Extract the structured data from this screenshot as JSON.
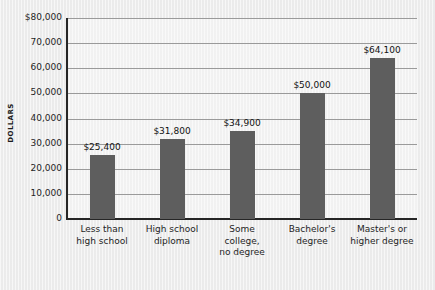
{
  "chart_data": {
    "type": "bar",
    "title": "",
    "xlabel": "",
    "ylabel": "DOLLARS",
    "ylim": [
      0,
      80000
    ],
    "grid": true,
    "legend": "none",
    "categories": [
      "Less than\nhigh school",
      "High school\ndiploma",
      "Some\ncollege,\nno degree",
      "Bachelor's\ndegree",
      "Master's or\nhigher degree"
    ],
    "values": [
      25400,
      31800,
      34900,
      50000,
      64100
    ],
    "value_labels": [
      "$25,400",
      "$31,800",
      "$34,900",
      "$50,000",
      "$64,100"
    ],
    "ytick_values": [
      0,
      10000,
      20000,
      30000,
      40000,
      50000,
      60000,
      70000,
      80000
    ],
    "ytick_labels": [
      "0",
      "10,000",
      "20,000",
      "30,000",
      "40,000",
      "50,000",
      "60,000",
      "70,000",
      "$80,000"
    ],
    "bar_color": "#5e5e5e",
    "background_color": "#eeeeee",
    "axis_color": "#262626",
    "grid_color": "#9a9a9a"
  },
  "axis": {
    "y_title": "DOLLARS"
  },
  "categories": [
    {
      "line1": "Less than",
      "line2": "high school",
      "line3": ""
    },
    {
      "line1": "High school",
      "line2": "diploma",
      "line3": ""
    },
    {
      "line1": "Some",
      "line2": "college,",
      "line3": "no degree"
    },
    {
      "line1": "Bachelor's",
      "line2": "degree",
      "line3": ""
    },
    {
      "line1": "Master's or",
      "line2": "higher degree",
      "line3": ""
    }
  ],
  "bars": [
    {
      "label": "$25,400"
    },
    {
      "label": "$31,800"
    },
    {
      "label": "$34,900"
    },
    {
      "label": "$50,000"
    },
    {
      "label": "$64,100"
    }
  ],
  "yticks": [
    {
      "label": "$80,000"
    },
    {
      "label": "70,000"
    },
    {
      "label": "60,000"
    },
    {
      "label": "50,000"
    },
    {
      "label": "40,000"
    },
    {
      "label": "30,000"
    },
    {
      "label": "20,000"
    },
    {
      "label": "10,000"
    },
    {
      "label": "0"
    }
  ]
}
